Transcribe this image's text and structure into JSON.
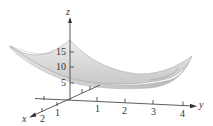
{
  "figure": {
    "type": "3d-surface-plot",
    "axes": {
      "x": {
        "label": "x",
        "ticks": [
          "1",
          "2"
        ]
      },
      "y": {
        "label": "y",
        "ticks": [
          "1",
          "2",
          "3",
          "4"
        ]
      },
      "z": {
        "label": "z",
        "ticks": [
          "5",
          "10",
          "15"
        ]
      }
    },
    "surface": {
      "fill": "#d9d9d9",
      "edge": "#9a9a9a",
      "shade": "#bdbdbd"
    },
    "axis_color": "#333333"
  }
}
